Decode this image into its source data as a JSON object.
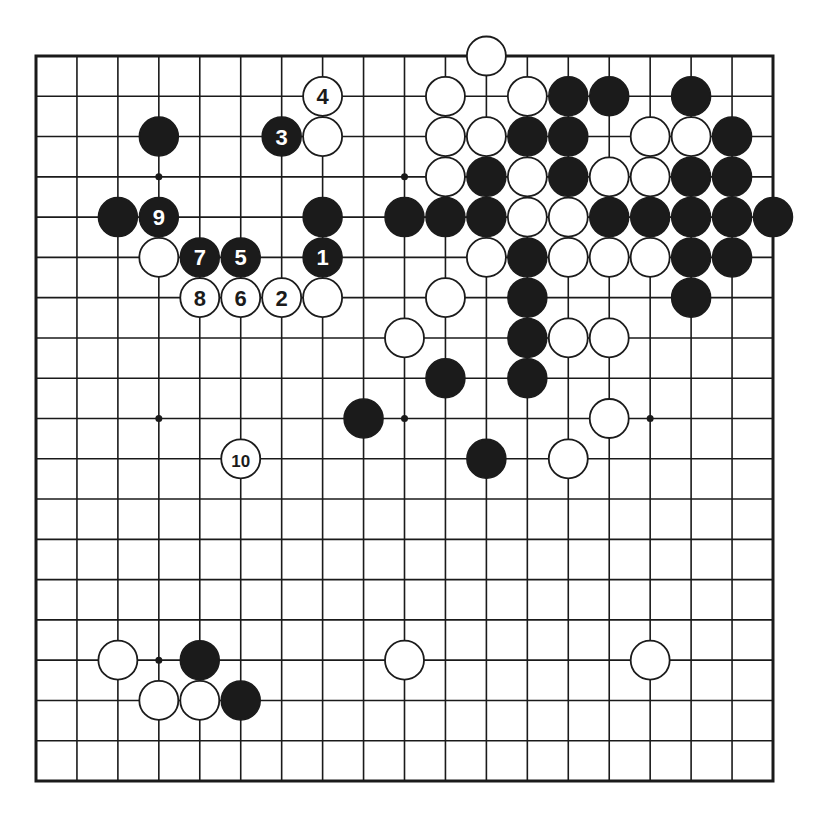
{
  "diagram": {
    "type": "go-board",
    "size": 19,
    "colors": {
      "line": "#1a1a1a",
      "black_stone": "#1b1b1b",
      "white_stone": "#ffffff",
      "background": "#ffffff"
    },
    "star_points": [
      [
        3,
        3
      ],
      [
        9,
        3
      ],
      [
        15,
        3
      ],
      [
        3,
        9
      ],
      [
        9,
        9
      ],
      [
        15,
        9
      ],
      [
        3,
        15
      ],
      [
        9,
        15
      ],
      [
        15,
        15
      ]
    ],
    "stones": [
      {
        "color": "white",
        "col": 11,
        "row": 0
      },
      {
        "color": "white",
        "col": 7,
        "row": 1,
        "label": "4"
      },
      {
        "color": "white",
        "col": 10,
        "row": 1
      },
      {
        "color": "white",
        "col": 12,
        "row": 1
      },
      {
        "color": "black",
        "col": 13,
        "row": 1
      },
      {
        "color": "black",
        "col": 14,
        "row": 1
      },
      {
        "color": "black",
        "col": 16,
        "row": 1
      },
      {
        "color": "black",
        "col": 3,
        "row": 2
      },
      {
        "color": "black",
        "col": 6,
        "row": 2,
        "label": "3"
      },
      {
        "color": "white",
        "col": 7,
        "row": 2
      },
      {
        "color": "white",
        "col": 10,
        "row": 2
      },
      {
        "color": "white",
        "col": 11,
        "row": 2
      },
      {
        "color": "black",
        "col": 12,
        "row": 2
      },
      {
        "color": "black",
        "col": 13,
        "row": 2
      },
      {
        "color": "white",
        "col": 15,
        "row": 2
      },
      {
        "color": "white",
        "col": 16,
        "row": 2
      },
      {
        "color": "black",
        "col": 17,
        "row": 2
      },
      {
        "color": "white",
        "col": 10,
        "row": 3
      },
      {
        "color": "black",
        "col": 11,
        "row": 3
      },
      {
        "color": "white",
        "col": 12,
        "row": 3
      },
      {
        "color": "black",
        "col": 13,
        "row": 3
      },
      {
        "color": "white",
        "col": 14,
        "row": 3
      },
      {
        "color": "white",
        "col": 15,
        "row": 3
      },
      {
        "color": "black",
        "col": 16,
        "row": 3
      },
      {
        "color": "black",
        "col": 17,
        "row": 3
      },
      {
        "color": "black",
        "col": 2,
        "row": 4
      },
      {
        "color": "black",
        "col": 3,
        "row": 4,
        "label": "9"
      },
      {
        "color": "black",
        "col": 7,
        "row": 4
      },
      {
        "color": "black",
        "col": 9,
        "row": 4
      },
      {
        "color": "black",
        "col": 10,
        "row": 4
      },
      {
        "color": "black",
        "col": 11,
        "row": 4
      },
      {
        "color": "white",
        "col": 12,
        "row": 4
      },
      {
        "color": "white",
        "col": 13,
        "row": 4
      },
      {
        "color": "black",
        "col": 14,
        "row": 4
      },
      {
        "color": "black",
        "col": 15,
        "row": 4
      },
      {
        "color": "black",
        "col": 16,
        "row": 4
      },
      {
        "color": "black",
        "col": 17,
        "row": 4
      },
      {
        "color": "black",
        "col": 18,
        "row": 4
      },
      {
        "color": "white",
        "col": 3,
        "row": 5
      },
      {
        "color": "black",
        "col": 4,
        "row": 5,
        "label": "7"
      },
      {
        "color": "black",
        "col": 5,
        "row": 5,
        "label": "5"
      },
      {
        "color": "black",
        "col": 7,
        "row": 5,
        "label": "1"
      },
      {
        "color": "white",
        "col": 11,
        "row": 5
      },
      {
        "color": "black",
        "col": 12,
        "row": 5
      },
      {
        "color": "white",
        "col": 13,
        "row": 5
      },
      {
        "color": "white",
        "col": 14,
        "row": 5
      },
      {
        "color": "white",
        "col": 15,
        "row": 5
      },
      {
        "color": "black",
        "col": 16,
        "row": 5
      },
      {
        "color": "black",
        "col": 17,
        "row": 5
      },
      {
        "color": "white",
        "col": 4,
        "row": 6,
        "label": "8"
      },
      {
        "color": "white",
        "col": 5,
        "row": 6,
        "label": "6"
      },
      {
        "color": "white",
        "col": 6,
        "row": 6,
        "label": "2"
      },
      {
        "color": "white",
        "col": 7,
        "row": 6
      },
      {
        "color": "white",
        "col": 10,
        "row": 6
      },
      {
        "color": "black",
        "col": 12,
        "row": 6
      },
      {
        "color": "black",
        "col": 16,
        "row": 6
      },
      {
        "color": "white",
        "col": 9,
        "row": 7
      },
      {
        "color": "black",
        "col": 12,
        "row": 7
      },
      {
        "color": "white",
        "col": 13,
        "row": 7
      },
      {
        "color": "white",
        "col": 14,
        "row": 7
      },
      {
        "color": "black",
        "col": 10,
        "row": 8
      },
      {
        "color": "black",
        "col": 12,
        "row": 8
      },
      {
        "color": "black",
        "col": 8,
        "row": 9
      },
      {
        "color": "white",
        "col": 14,
        "row": 9
      },
      {
        "color": "white",
        "col": 5,
        "row": 10,
        "label": "10"
      },
      {
        "color": "black",
        "col": 11,
        "row": 10
      },
      {
        "color": "white",
        "col": 13,
        "row": 10
      },
      {
        "color": "white",
        "col": 2,
        "row": 15
      },
      {
        "color": "black",
        "col": 4,
        "row": 15
      },
      {
        "color": "white",
        "col": 9,
        "row": 15
      },
      {
        "color": "white",
        "col": 15,
        "row": 15
      },
      {
        "color": "white",
        "col": 3,
        "row": 16
      },
      {
        "color": "white",
        "col": 4,
        "row": 16
      },
      {
        "color": "black",
        "col": 5,
        "row": 16
      }
    ],
    "move_sequence": [
      "1",
      "2",
      "3",
      "4",
      "5",
      "6",
      "7",
      "8",
      "9",
      "10"
    ]
  }
}
